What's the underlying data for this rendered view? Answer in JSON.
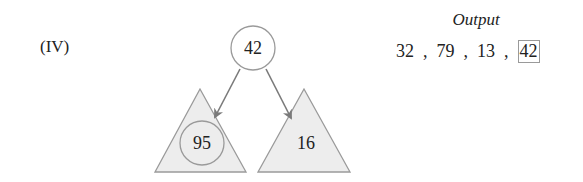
{
  "step_label": "(IV)",
  "tree": {
    "root": {
      "value": "42"
    },
    "left_subtree": {
      "root_value": "95"
    },
    "right_subtree": {
      "root_value": "16"
    }
  },
  "output": {
    "title": "Output",
    "items": [
      "32",
      "79",
      "13",
      "42"
    ],
    "separator": ",",
    "highlighted_index": 3
  },
  "colors": {
    "stroke": "#9a9a9a",
    "arrow": "#7a7a7a",
    "triangle_fill": "#ededed",
    "text": "#222222"
  }
}
